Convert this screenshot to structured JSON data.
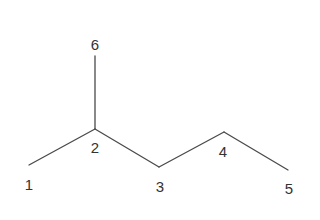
{
  "diagram": {
    "type": "skeletal-formula",
    "colors": {
      "background": "#ffffff",
      "bond": "#4a4a4a",
      "label": "#333333"
    },
    "atoms": [
      {
        "id": "1",
        "label": "1",
        "x": 29,
        "y": 165,
        "label_x": 29,
        "label_y": 190
      },
      {
        "id": "2",
        "label": "2",
        "x": 95,
        "y": 129,
        "label_x": 95,
        "label_y": 153
      },
      {
        "id": "3",
        "label": "3",
        "x": 159,
        "y": 167,
        "label_x": 160,
        "label_y": 192
      },
      {
        "id": "4",
        "label": "4",
        "x": 224,
        "y": 132,
        "label_x": 223,
        "label_y": 157
      },
      {
        "id": "5",
        "label": "5",
        "x": 288,
        "y": 170,
        "label_x": 289,
        "label_y": 194
      },
      {
        "id": "6",
        "label": "6",
        "x": 95,
        "y": 56,
        "label_x": 95,
        "label_y": 50
      }
    ],
    "bonds": [
      {
        "from": "1",
        "to": "2"
      },
      {
        "from": "2",
        "to": "6"
      },
      {
        "from": "2",
        "to": "3"
      },
      {
        "from": "3",
        "to": "4"
      },
      {
        "from": "4",
        "to": "5"
      }
    ]
  }
}
